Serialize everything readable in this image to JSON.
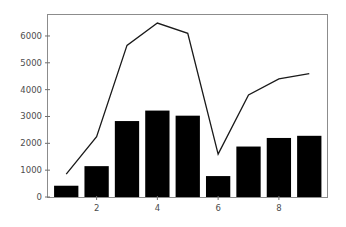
{
  "chart_data": {
    "type": "bar",
    "title": "",
    "subtitle": "",
    "xlabel": "",
    "ylabel": "",
    "x": [
      1,
      2,
      3,
      4,
      5,
      6,
      7,
      8,
      9
    ],
    "categories": [
      "1",
      "2",
      "3",
      "4",
      "5",
      "6",
      "7",
      "8",
      "9"
    ],
    "series": [
      {
        "name": "bars",
        "type": "bar",
        "color": "#000000",
        "values": [
          420,
          1150,
          2830,
          3220,
          3030,
          780,
          1880,
          2200,
          2280
        ]
      },
      {
        "name": "line",
        "type": "line",
        "color": "#1a1a1a",
        "values": [
          850,
          2250,
          5650,
          6480,
          6100,
          1600,
          3800,
          4400,
          4600
        ]
      }
    ],
    "xlim": [
      0.4,
      9.6
    ],
    "ylim": [
      0,
      6800
    ],
    "yticks": [
      0,
      1000,
      2000,
      3000,
      4000,
      5000,
      6000
    ],
    "ytick_labels": [
      "0",
      "1000",
      "2000",
      "3000",
      "4000",
      "5000",
      "6000"
    ],
    "xticks": [
      2,
      4,
      6,
      8
    ],
    "xtick_labels": [
      "2",
      "4",
      "6",
      "8"
    ],
    "grid": false,
    "legend": null,
    "legend_position": "none",
    "frame_color": "#8c8c8c",
    "background_color": "#ffffff"
  }
}
